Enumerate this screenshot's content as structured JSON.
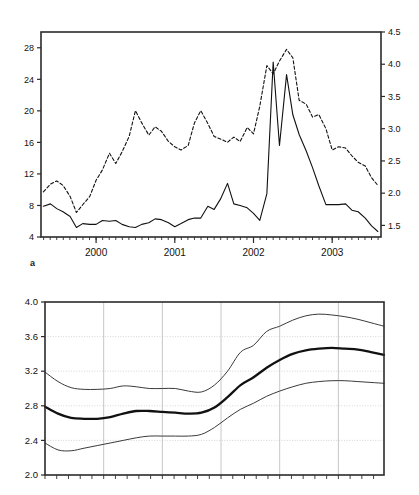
{
  "figure": {
    "panel_a_label": "a",
    "panels": [
      "a",
      "b"
    ]
  },
  "chart_data": [
    {
      "type": "line",
      "id": "panel-a",
      "title": "",
      "xlabel": "",
      "ylabel": "",
      "grid": false,
      "legend": false,
      "x_ticklabels": [
        "2000",
        "2001",
        "2002",
        "2003"
      ],
      "x_tick_values": [
        2000,
        2001,
        2002,
        2003
      ],
      "xlim": [
        1999.3,
        2003.62
      ],
      "x_minor_tick_step": 0.0833,
      "left_axis": {
        "ylim": [
          4,
          30
        ],
        "ticklabels": [
          "4",
          "8",
          "12",
          "16",
          "20",
          "24",
          "28"
        ],
        "tick_values": [
          4,
          8,
          12,
          16,
          20,
          24,
          28
        ]
      },
      "right_axis": {
        "ylim": [
          1.32,
          4.5
        ],
        "ticklabels": [
          "1.5",
          "2.0",
          "2.5",
          "3.0",
          "3.5",
          "4.0",
          "4.5"
        ],
        "tick_values": [
          1.5,
          2.0,
          2.5,
          3.0,
          3.5,
          4.0,
          4.5
        ]
      },
      "series": [
        {
          "name": "solid-series",
          "axis": "left",
          "style": "solid",
          "x": [
            1999.33,
            1999.42,
            1999.5,
            1999.58,
            1999.67,
            1999.75,
            1999.83,
            1999.92,
            2000.0,
            2000.08,
            2000.17,
            2000.25,
            2000.33,
            2000.42,
            2000.5,
            2000.58,
            2000.67,
            2000.75,
            2000.83,
            2000.92,
            2001.0,
            2001.08,
            2001.17,
            2001.25,
            2001.33,
            2001.42,
            2001.5,
            2001.58,
            2001.67,
            2001.75,
            2001.83,
            2001.92,
            2002.0,
            2002.08,
            2002.17,
            2002.25,
            2002.33,
            2002.42,
            2002.5,
            2002.58,
            2002.67,
            2002.75,
            2002.83,
            2002.92,
            2003.0,
            2003.08,
            2003.17,
            2003.25,
            2003.33,
            2003.42,
            2003.5,
            2003.58
          ],
          "values": [
            7.9,
            8.2,
            7.6,
            7.2,
            6.6,
            5.2,
            5.7,
            5.6,
            5.6,
            6.1,
            6.0,
            6.1,
            5.6,
            5.3,
            5.2,
            5.6,
            5.8,
            6.3,
            6.2,
            5.8,
            5.3,
            5.7,
            6.2,
            6.4,
            6.4,
            7.9,
            7.5,
            8.8,
            10.8,
            8.2,
            8.0,
            7.7,
            7.0,
            6.1,
            9.5,
            26.2,
            15.6,
            24.6,
            19.5,
            17.0,
            14.9,
            12.8,
            10.5,
            8.1,
            8.1,
            8.1,
            8.2,
            7.4,
            7.2,
            6.4,
            5.4,
            4.7
          ]
        },
        {
          "name": "dashed-series",
          "axis": "right",
          "style": "dashed",
          "x": [
            1999.33,
            1999.42,
            1999.5,
            1999.58,
            1999.67,
            1999.75,
            1999.83,
            1999.92,
            2000.0,
            2000.08,
            2000.17,
            2000.25,
            2000.33,
            2000.42,
            2000.5,
            2000.58,
            2000.67,
            2000.75,
            2000.83,
            2000.92,
            2001.0,
            2001.08,
            2001.17,
            2001.25,
            2001.33,
            2001.42,
            2001.5,
            2001.58,
            2001.67,
            2001.75,
            2001.83,
            2001.92,
            2002.0,
            2002.08,
            2002.17,
            2002.25,
            2002.33,
            2002.42,
            2002.5,
            2002.58,
            2002.67,
            2002.75,
            2002.83,
            2002.92,
            2003.0,
            2003.08,
            2003.17,
            2003.25,
            2003.33,
            2003.42,
            2003.5,
            2003.58
          ],
          "values": [
            2.02,
            2.14,
            2.19,
            2.12,
            1.95,
            1.7,
            1.82,
            1.95,
            2.2,
            2.36,
            2.62,
            2.46,
            2.64,
            2.88,
            3.28,
            3.09,
            2.9,
            3.03,
            2.96,
            2.8,
            2.72,
            2.67,
            2.74,
            3.09,
            3.28,
            3.08,
            2.88,
            2.84,
            2.79,
            2.87,
            2.8,
            3.02,
            2.92,
            3.35,
            3.98,
            3.85,
            4.05,
            4.23,
            4.1,
            3.44,
            3.38,
            3.18,
            3.22,
            3.0,
            2.67,
            2.72,
            2.7,
            2.58,
            2.48,
            2.42,
            2.24,
            2.12
          ]
        }
      ]
    },
    {
      "type": "line",
      "id": "panel-b",
      "title": "",
      "xlabel": "",
      "ylabel": "",
      "grid": true,
      "legend": false,
      "ylim": [
        2.0,
        4.0
      ],
      "y_ticklabels": [
        "2.0",
        "2.4",
        "2.8",
        "3.2",
        "3.6",
        "4.0"
      ],
      "y_tick_values": [
        2.0,
        2.4,
        2.8,
        3.2,
        3.6,
        4.0
      ],
      "xlim": [
        0,
        52
      ],
      "x_gridline_positions": [
        9,
        18,
        27,
        36,
        45
      ],
      "x_minor_tick_step": 1.8,
      "series": [
        {
          "name": "upper-band",
          "style": "thin",
          "x": [
            0,
            2,
            4,
            6,
            8,
            10,
            12,
            14,
            16,
            18,
            20,
            22,
            24,
            26,
            28,
            30,
            32,
            34,
            36,
            38,
            40,
            42,
            44,
            46,
            48,
            50,
            52
          ],
          "values": [
            3.19,
            3.08,
            3.01,
            2.99,
            2.99,
            3.0,
            3.03,
            3.02,
            3.0,
            3.0,
            3.0,
            2.97,
            2.96,
            3.04,
            3.2,
            3.42,
            3.5,
            3.66,
            3.72,
            3.79,
            3.84,
            3.86,
            3.85,
            3.83,
            3.8,
            3.76,
            3.72
          ]
        },
        {
          "name": "central-line",
          "style": "thick",
          "x": [
            0,
            2,
            4,
            6,
            8,
            10,
            12,
            14,
            16,
            18,
            20,
            22,
            24,
            26,
            28,
            30,
            32,
            34,
            36,
            38,
            40,
            42,
            44,
            46,
            48,
            50,
            52
          ],
          "values": [
            2.79,
            2.71,
            2.66,
            2.65,
            2.65,
            2.67,
            2.71,
            2.74,
            2.74,
            2.73,
            2.72,
            2.71,
            2.72,
            2.78,
            2.9,
            3.04,
            3.13,
            3.24,
            3.33,
            3.4,
            3.44,
            3.46,
            3.47,
            3.46,
            3.45,
            3.42,
            3.39
          ]
        },
        {
          "name": "lower-band",
          "style": "thin",
          "x": [
            0,
            2,
            4,
            6,
            8,
            10,
            12,
            14,
            16,
            18,
            20,
            22,
            24,
            26,
            28,
            30,
            32,
            34,
            36,
            38,
            40,
            42,
            44,
            46,
            48,
            50,
            52
          ],
          "values": [
            2.37,
            2.29,
            2.28,
            2.31,
            2.34,
            2.37,
            2.4,
            2.43,
            2.45,
            2.45,
            2.45,
            2.45,
            2.47,
            2.55,
            2.66,
            2.76,
            2.83,
            2.91,
            2.97,
            3.02,
            3.06,
            3.08,
            3.09,
            3.09,
            3.08,
            3.07,
            3.06
          ]
        }
      ]
    }
  ],
  "colors": {
    "axis": "#2b2b2b",
    "line_solid": "#111111",
    "line_dashed": "#111111",
    "grid": "#cccccc",
    "background": "#ffffff"
  }
}
